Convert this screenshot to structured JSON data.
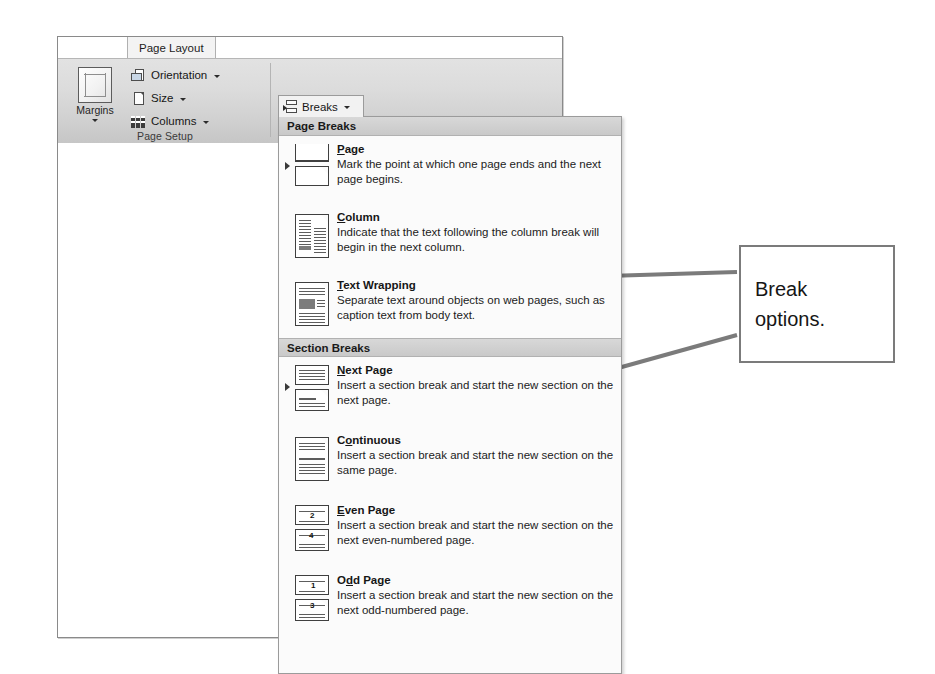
{
  "window": {
    "tab_label": "Page Layout",
    "group_label": "Page Setup"
  },
  "ribbon": {
    "margins_label": "Margins",
    "margins_icon": "margins-icon",
    "buttons": [
      {
        "label": "Orientation",
        "icon": "orientation-icon"
      },
      {
        "label": "Size",
        "icon": "size-icon"
      },
      {
        "label": "Columns",
        "icon": "columns-icon"
      }
    ],
    "breaks_label": "Breaks",
    "breaks_icon": "breaks-icon"
  },
  "menu": {
    "sections": [
      {
        "header": "Page Breaks",
        "items": [
          {
            "title_pre": "",
            "title_accel": "P",
            "title_post": "age",
            "title": "Page",
            "desc": "Mark the point at which one page ends and the next page begins.",
            "icon": "page-break-icon"
          },
          {
            "title_pre": "",
            "title_accel": "C",
            "title_post": "olumn",
            "title": "Column",
            "desc": "Indicate that the text following the column break will begin in the next column.",
            "icon": "column-break-icon"
          },
          {
            "title_pre": "",
            "title_accel": "T",
            "title_post": "ext Wrapping",
            "title": "Text Wrapping",
            "desc": "Separate text around objects on web pages, such as caption text from body text.",
            "icon": "text-wrapping-break-icon"
          }
        ]
      },
      {
        "header": "Section Breaks",
        "items": [
          {
            "title_pre": "",
            "title_accel": "N",
            "title_post": "ext Page",
            "title": "Next Page",
            "desc": "Insert a section break and start the new section on the next page.",
            "icon": "next-page-break-icon"
          },
          {
            "title_pre": "C",
            "title_accel": "o",
            "title_post": "ntinuous",
            "title": "Continuous",
            "desc": "Insert a section break and start the new section on the same page.",
            "icon": "continuous-break-icon"
          },
          {
            "title_pre": "",
            "title_accel": "E",
            "title_post": "ven Page",
            "title": "Even Page",
            "desc": "Insert a section break and start the new section on the next even-numbered page.",
            "icon": "even-page-break-icon",
            "num_top": "2",
            "num_bottom": "4"
          },
          {
            "title_pre": "O",
            "title_accel": "d",
            "title_post": "d Page",
            "title": "Odd Page",
            "desc": "Insert a section break and start the new section on the next odd-numbered page.",
            "icon": "odd-page-break-icon",
            "num_top": "1",
            "num_bottom": "3"
          }
        ]
      }
    ]
  },
  "annotation": {
    "line1": "Break",
    "line2": "options.",
    "border_color": "#7b7b7b",
    "arrow_color": "#7b7b7b"
  }
}
